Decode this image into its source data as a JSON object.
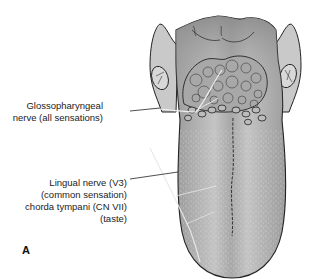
{
  "figure": {
    "panel_label": "A",
    "labels": [
      {
        "id": "glossopharyngeal",
        "lines": [
          "Glossopharyngeal",
          "nerve (all sensations)"
        ]
      },
      {
        "id": "lingual",
        "lines": [
          "Lingual nerve (V3)",
          "(common sensation)",
          "chorda tympani (CN VII)",
          "(taste)"
        ]
      }
    ],
    "colors": {
      "tongue_fill": "#9a9a9a",
      "tongue_anterior": "#b8b8b8",
      "outline": "#222222",
      "text": "#222222",
      "background": "#ffffff"
    }
  }
}
